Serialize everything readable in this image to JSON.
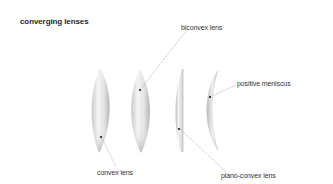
{
  "title": "converging lenses",
  "labels": {
    "biconvex": "biconvex lens",
    "positive_meniscus": "positive meniscus",
    "convex": "convex lens",
    "plano_convex": "plano-convex lens"
  },
  "lenses": [
    {
      "name": "convex lens",
      "shape": "asymmetric convex"
    },
    {
      "name": "biconvex lens",
      "shape": "symmetric convex"
    },
    {
      "name": "plano-convex lens",
      "shape": "one flat, one convex"
    },
    {
      "name": "positive meniscus",
      "shape": "crescent"
    }
  ],
  "colors": {
    "background": "#ffffff",
    "text": "#333333",
    "leader_line": "#888888",
    "lens_light": "#f7f7f7",
    "lens_dark": "#a9a9a9"
  }
}
